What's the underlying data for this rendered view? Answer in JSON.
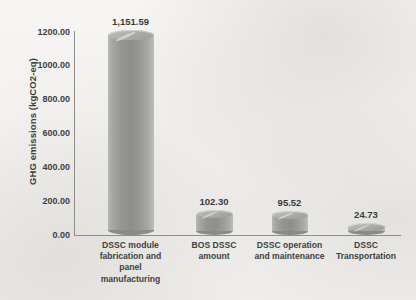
{
  "chart_data": {
    "type": "bar",
    "title": "",
    "xlabel": "",
    "ylabel": "GHG emissions (kgCO2-eq)",
    "categories": [
      "DSSC module fabrication and panel manufacturing",
      "BOS DSSC amount",
      "DSSC operation and maintenance",
      "DSSC Transportation"
    ],
    "category_lines": [
      [
        "DSSC module",
        "fabrication and",
        "panel",
        "manufacturing"
      ],
      [
        "BOS DSSC",
        "amount"
      ],
      [
        "DSSC operation",
        "and maintenance"
      ],
      [
        "DSSC",
        "Transportation"
      ]
    ],
    "values": [
      1151.59,
      102.3,
      95.52,
      24.73
    ],
    "data_labels": [
      "1,151.59",
      "102.30",
      "95.52",
      "24.73"
    ],
    "ylim": [
      0,
      1200
    ],
    "ytick_values": [
      0,
      200,
      400,
      600,
      800,
      1000,
      1200
    ],
    "ytick_labels": [
      "0.00",
      "200.00",
      "400.00",
      "600.00",
      "800.00",
      "1000.00",
      "1200.00"
    ],
    "grid": false,
    "legend": false,
    "bar_style": "cylinder-3d",
    "colors": {
      "bar_fill": "#949492",
      "bar_top": "#adadab",
      "axis_line": "#8d8d8d",
      "text": "#3f3f3f",
      "background": "#f4f3f1"
    }
  }
}
